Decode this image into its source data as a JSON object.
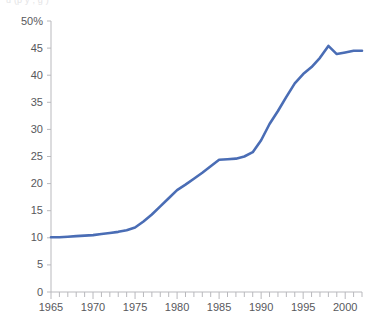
{
  "top_clip": {
    "text": "u  (p y  ,   g     )"
  },
  "colors": {
    "line": "#4a6db5",
    "axis": "#b9b9bd",
    "tick": "#b9b9bd",
    "text": "#58585c",
    "background": "#ffffff"
  },
  "chart_data": {
    "type": "line",
    "title": "",
    "subtitle": "",
    "xlabel": "",
    "ylabel": "",
    "xlim": [
      1965,
      2002
    ],
    "ylim": [
      0,
      50
    ],
    "grid": false,
    "legend": "none",
    "y_ticks": [
      0,
      5,
      10,
      15,
      20,
      25,
      30,
      35,
      40,
      45,
      50
    ],
    "y_tick_labels": [
      "0",
      "5",
      "10",
      "15",
      "20",
      "25",
      "30",
      "35",
      "40",
      "45",
      "50%"
    ],
    "y_unit": "%",
    "x_ticks_major": [
      1965,
      1970,
      1975,
      1980,
      1985,
      1990,
      1995,
      2000
    ],
    "x_tick_labels": [
      "1965",
      "1970",
      "1975",
      "1980",
      "1985",
      "1990",
      "1995",
      "2000"
    ],
    "x_minor_tick_step": 1,
    "series": [
      {
        "name": "",
        "color": "#4a6db5",
        "x": [
          1965,
          1966,
          1967,
          1968,
          1969,
          1970,
          1971,
          1972,
          1973,
          1974,
          1975,
          1976,
          1977,
          1978,
          1979,
          1980,
          1981,
          1982,
          1983,
          1984,
          1985,
          1986,
          1987,
          1988,
          1989,
          1990,
          1991,
          1992,
          1993,
          1994,
          1995,
          1996,
          1997,
          1998,
          1999,
          2000,
          2001,
          2002
        ],
        "values": [
          10.1,
          10.1,
          10.2,
          10.3,
          10.4,
          10.5,
          10.7,
          10.9,
          11.1,
          11.4,
          11.9,
          13.0,
          14.3,
          15.8,
          17.3,
          18.8,
          19.8,
          20.9,
          22.0,
          23.2,
          24.4,
          24.5,
          24.6,
          25.0,
          25.8,
          28.0,
          31.0,
          33.4,
          36.0,
          38.5,
          40.2,
          41.5,
          43.2,
          45.4,
          43.9,
          44.2,
          44.5,
          44.5
        ]
      }
    ]
  }
}
